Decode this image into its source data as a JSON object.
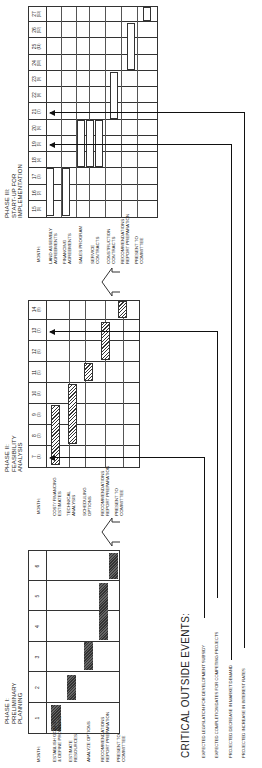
{
  "phases": [
    {
      "title": "PHASE I:\nPRELIMINARY\nPLANNING",
      "month_label": "MONTH:",
      "months": [
        "1",
        "2",
        "3",
        "4",
        "5",
        "6"
      ],
      "tasks": [
        {
          "label": "ESTABLISH GOALS\n& DEFINE PROBLEMS",
          "start": 1,
          "end": 1,
          "style": "solid"
        },
        {
          "label": "ESTIMATE\nRESOURCES",
          "start": 2,
          "end": 2,
          "style": "solid"
        },
        {
          "label": "ANALYZE OPTIONS",
          "start": 3,
          "end": 3,
          "style": "solid"
        },
        {
          "label": "RECOMMENDATIONS\nREPORT PREPARATION",
          "start": 4,
          "end": 5,
          "style": "solid"
        },
        {
          "label": "PRESENT TO\nCOMMITTEE",
          "start": 6,
          "end": 6,
          "style": "solid"
        }
      ]
    },
    {
      "title": "PHASE II:\nFEASIBILITY\nANALYSIS",
      "month_label": "MONTH:",
      "months": [
        {
          "n": "7",
          "sub": "(1)"
        },
        {
          "n": "8",
          "sub": "(2)"
        },
        {
          "n": "9",
          "sub": "(3)"
        },
        {
          "n": "10",
          "sub": "(4)"
        },
        {
          "n": "11",
          "sub": "(5)"
        },
        {
          "n": "12",
          "sub": "(6)"
        },
        {
          "n": "13",
          "sub": "(7)"
        },
        {
          "n": "14",
          "sub": "(8)"
        }
      ],
      "tasks": [
        {
          "label": "COST/ FINANCING\nESTIMATES",
          "start": 7,
          "end": 9,
          "style": "hatched"
        },
        {
          "label": "TECHNICAL\nANALYSIS",
          "start": 8,
          "end": 10,
          "style": "hatched"
        },
        {
          "label": "SCHEDULING\nOPTIONS",
          "start": 11,
          "end": 11,
          "style": "hatched"
        },
        {
          "label": "RECOMMENDATIONS\nREPORT PREPARATION",
          "start": 12,
          "end": 13,
          "style": "hatched"
        },
        {
          "label": "PRESENT TO\nCOMMITTEE",
          "start": 14,
          "end": 14,
          "style": "hatched"
        }
      ]
    },
    {
      "title": "PHASE III:\nSTART-UP FOR\nIMPLEMENTATION",
      "month_label": "MONTH:",
      "months": [
        {
          "n": "15",
          "sub": "(1)"
        },
        {
          "n": "16",
          "sub": "(2)"
        },
        {
          "n": "17",
          "sub": "(3)"
        },
        {
          "n": "18",
          "sub": "(4)"
        },
        {
          "n": "19",
          "sub": "(5)"
        },
        {
          "n": "20",
          "sub": "(6)"
        },
        {
          "n": "21",
          "sub": "(7)"
        },
        {
          "n": "22",
          "sub": "(8)"
        },
        {
          "n": "23",
          "sub": "(9)"
        },
        {
          "n": "24",
          "sub": "(10)"
        },
        {
          "n": "25",
          "sub": "(11)"
        },
        {
          "n": "26",
          "sub": "(12)"
        },
        {
          "n": "27",
          "sub": "(13)"
        }
      ],
      "tasks": [
        {
          "label": "LAND ASSEMBLY\nAGREEMENTS",
          "start": 15,
          "end": 17,
          "style": "open"
        },
        {
          "label": "FINANCING\nAGREEMENTS",
          "start": 15,
          "end": 17,
          "style": "open"
        },
        {
          "label": "SALES PROGRAM",
          "start": 18,
          "end": 20,
          "style": "open"
        },
        {
          "label": "SERVICE\nCONTRACTS",
          "start": 18,
          "end": 20,
          "style": "open"
        },
        {
          "label": "CONSTRUCTION\nCONTRACTS",
          "start": 18,
          "end": 20,
          "style": "open"
        },
        {
          "label": "RECOMMENDATIONS\nREPORT PREPARATION",
          "start": 21,
          "end": 23,
          "style": "open"
        },
        {
          "label": "PRESENT TO\nCOMMITTEE",
          "start": 24,
          "end": 26,
          "style": "open"
        },
        {
          "label": "",
          "start": 27,
          "end": 27,
          "style": "open"
        }
      ]
    }
  ],
  "critical_events": {
    "title": "CRITICAL OUTSIDE EVENTS:",
    "items": [
      {
        "label": "EXPECTED LEGISLATION FOR DEVELOPMENT SUBSIDY",
        "target_month": "7"
      },
      {
        "label": "EXPECTED COMPLETION DATES FOR COMPETING PROJECTS",
        "target_month": "13"
      },
      {
        "label": "PROJECTED DECREASE IN MARKET DEMAND",
        "target_month": "19"
      },
      {
        "label": "PROJECTED INCREASE IN INTEREST RATES",
        "target_month": "21"
      }
    ]
  },
  "colors": {
    "line": "#333333",
    "bar_solid": "#444444",
    "background": "#ffffff"
  }
}
